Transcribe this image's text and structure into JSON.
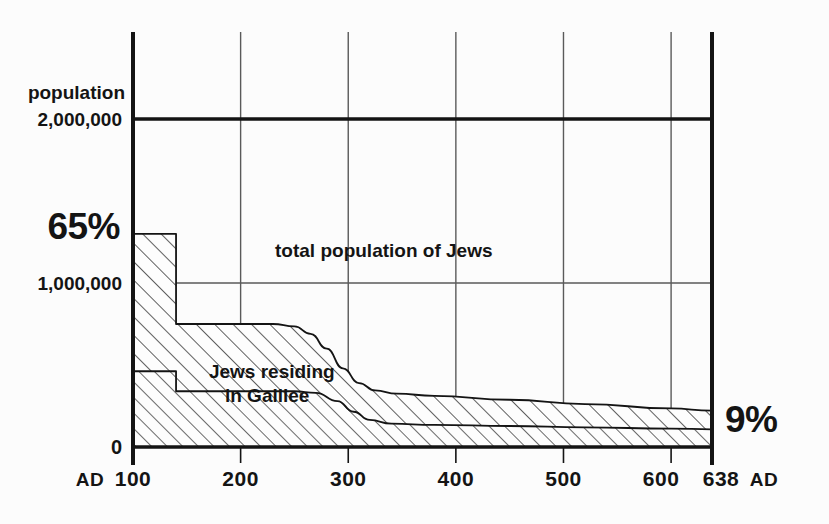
{
  "figure": {
    "background_color": "#fcfcfc",
    "ink_color": "#141414",
    "grid_color": "#5a5a5a"
  },
  "chart_data": {
    "type": "area",
    "title": "",
    "subtitle": "",
    "xlabel": "",
    "ylabel": "population",
    "grid": true,
    "legend_position": "inline-annotation",
    "xlim": [
      100,
      638
    ],
    "ylim": [
      0,
      2000000
    ],
    "x_tick_labels": [
      "100",
      "200",
      "300",
      "400",
      "500",
      "600",
      "638"
    ],
    "x_ticks": [
      100,
      200,
      300,
      400,
      500,
      600,
      638
    ],
    "x_era_prefix": "AD",
    "x_era_suffix": "AD",
    "y_ticks": [
      0,
      1000000,
      2000000
    ],
    "y_tick_labels": [
      "0",
      "1,000,000",
      "2,000,000"
    ],
    "y_axis_caption": "population",
    "annotations": [
      {
        "name": "start-share",
        "text": "65%",
        "x": 100,
        "y": 1350000
      },
      {
        "name": "end-share",
        "text": "9%",
        "x": 638,
        "y": 170000
      }
    ],
    "series": [
      {
        "name": "total population of Jews",
        "label": "total population of Jews",
        "label_x": 232,
        "label_y": 1160000,
        "fill": "hatch-45",
        "values": [
          {
            "x": 100,
            "y": 1300000
          },
          {
            "x": 140,
            "y": 1300000
          },
          {
            "x": 140,
            "y": 750000
          },
          {
            "x": 230,
            "y": 750000
          },
          {
            "x": 250,
            "y": 735000
          },
          {
            "x": 265,
            "y": 690000
          },
          {
            "x": 280,
            "y": 600000
          },
          {
            "x": 295,
            "y": 480000
          },
          {
            "x": 310,
            "y": 390000
          },
          {
            "x": 325,
            "y": 345000
          },
          {
            "x": 345,
            "y": 325000
          },
          {
            "x": 380,
            "y": 312000
          },
          {
            "x": 450,
            "y": 288000
          },
          {
            "x": 520,
            "y": 262000
          },
          {
            "x": 600,
            "y": 235000
          },
          {
            "x": 638,
            "y": 222000
          }
        ]
      },
      {
        "name": "Jews residing in Galilee",
        "label": "Jews residing in Galilee",
        "label_x": 152,
        "label_y": 420000,
        "fill": "hatch-45",
        "values": [
          {
            "x": 100,
            "y": 462000
          },
          {
            "x": 140,
            "y": 462000
          },
          {
            "x": 140,
            "y": 340000
          },
          {
            "x": 250,
            "y": 340000
          },
          {
            "x": 270,
            "y": 330000
          },
          {
            "x": 290,
            "y": 280000
          },
          {
            "x": 305,
            "y": 215000
          },
          {
            "x": 320,
            "y": 165000
          },
          {
            "x": 340,
            "y": 142000
          },
          {
            "x": 380,
            "y": 135000
          },
          {
            "x": 450,
            "y": 128000
          },
          {
            "x": 520,
            "y": 120000
          },
          {
            "x": 600,
            "y": 112000
          },
          {
            "x": 638,
            "y": 108000
          }
        ]
      }
    ]
  }
}
